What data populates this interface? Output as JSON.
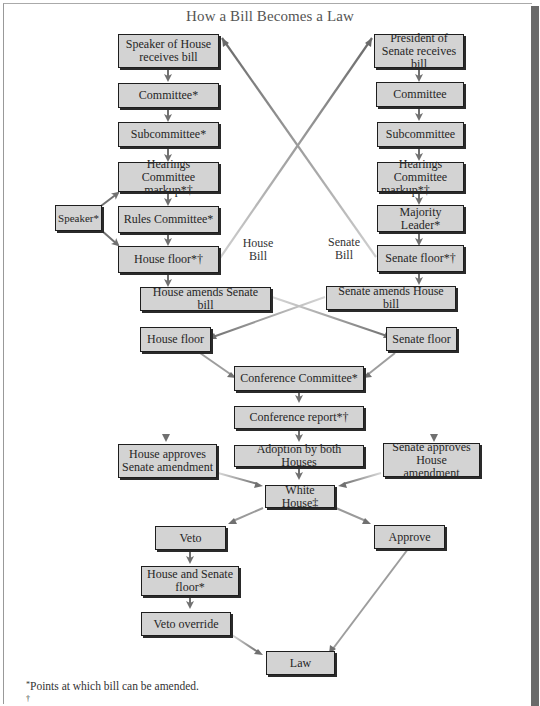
{
  "title": "How a Bill Becomes a Law",
  "colors": {
    "box_fill": "#d3d3d3",
    "box_border": "#1e1e1e",
    "arrow": "#707070",
    "arrow_light": "#bdbdbd"
  },
  "house_column": {
    "receives": "Speaker of House receives bill",
    "committee": "Committee*",
    "subcommittee": "Subcommittee*",
    "hearings_line1": "Hearings Committee",
    "hearings_line2": "markup*†",
    "rules": "Rules Committee*",
    "floor": "House floor*†",
    "speaker_side": "Speaker*"
  },
  "senate_column": {
    "receives": "President of Senate receives bill",
    "committee": "Committee",
    "subcommittee": "Subcommittee",
    "hearings_line1": "Hearings Committee",
    "hearings_line2": "markup*†",
    "majority_leader": "Majority Leader*",
    "floor": "Senate floor*†"
  },
  "cross_labels": {
    "house_bill_1": "House",
    "house_bill_2": "Bill",
    "senate_bill_1": "Senate",
    "senate_bill_2": "Bill"
  },
  "amend": {
    "house_amends": "House amends Senate bill",
    "senate_amends": "Senate amends House bill",
    "house_floor": "House floor",
    "senate_floor": "Senate floor"
  },
  "conference": {
    "committee": "Conference Committee*",
    "report": "Conference report*†",
    "adoption": "Adoption by both Houses",
    "house_approves": "House approves Senate amendment",
    "senate_approves": "Senate approves House amendment"
  },
  "executive": {
    "white_house": "White House‡",
    "veto": "Veto",
    "approve": "Approve",
    "house_senate_floor": "House and Senate floor*",
    "veto_override": "Veto override",
    "law": "Law"
  },
  "footnotes": [
    {
      "mark": "*",
      "text": "Points at which bill can be amended."
    },
    {
      "mark": "†",
      "text": ""
    }
  ]
}
